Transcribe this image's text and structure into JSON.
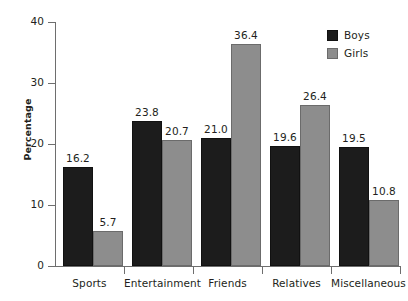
{
  "chart_data": {
    "type": "bar",
    "title": "",
    "subtitle": "",
    "xlabel": "",
    "ylabel": "Percentage",
    "ylim": [
      0,
      40
    ],
    "ytick_labels": [
      "0",
      "10",
      "20",
      "30",
      "40"
    ],
    "ytick_values": [
      0,
      10,
      20,
      30,
      40
    ],
    "grid": false,
    "legend_position": "top-right",
    "categories": [
      "Sports",
      "Entertainment",
      "Friends",
      "Relatives",
      "Miscellaneous"
    ],
    "series": [
      {
        "name": "Boys",
        "color": "#1c1c1c",
        "values": [
          16.2,
          23.8,
          21.0,
          19.6,
          19.5
        ],
        "labels": [
          "16.2",
          "23.8",
          "21.0",
          "19.6",
          "19.5"
        ]
      },
      {
        "name": "Girls",
        "color": "#8d8d8d",
        "values": [
          5.7,
          20.7,
          36.4,
          26.4,
          10.8
        ],
        "labels": [
          "5.7",
          "20.7",
          "36.4",
          "26.4",
          "10.8"
        ]
      }
    ]
  },
  "legend": {
    "items": [
      {
        "label": "Boys",
        "swatch": "boys-swatch"
      },
      {
        "label": "Girls",
        "swatch": "girls-swatch"
      }
    ]
  },
  "colors": {
    "boys": "#1c1c1c",
    "girls": "#8d8d8d",
    "axis": "#6e6e6e",
    "text": "#231f20",
    "background": "#ffffff"
  }
}
